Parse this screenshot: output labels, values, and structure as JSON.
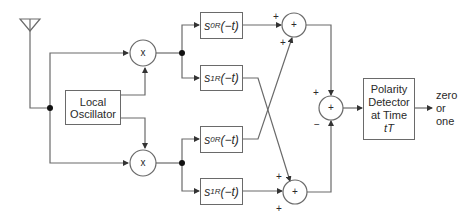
{
  "diagram": {
    "title": "",
    "blocks": {
      "local_oscillator": [
        "Local",
        "Oscillator"
      ],
      "polarity_detector": [
        "Polarity",
        "Detector",
        "at Time",
        "tT"
      ],
      "filter_upper_0": {
        "sym": "s",
        "sub": "0R",
        "arg": "(−t)"
      },
      "filter_upper_1": {
        "sym": "s",
        "sub": "1R",
        "arg": "(−t)"
      },
      "filter_lower_0": {
        "sym": "s",
        "sub": "0R",
        "arg": "(−t)"
      },
      "filter_lower_1": {
        "sym": "s",
        "sub": "1R",
        "arg": "(−t)"
      }
    },
    "operators": {
      "multiplier_symbol": "x",
      "summer_symbol": "+"
    },
    "signs": {
      "upper_summer_a": "+",
      "upper_summer_b": "+",
      "lower_summer_a": "+",
      "lower_summer_b": "+",
      "final_summer_top": "+",
      "final_summer_bottom": "−"
    },
    "output_label": [
      "zero",
      "or",
      "one"
    ],
    "icons": {
      "antenna": "antenna-icon"
    },
    "colors": {
      "line": "#6a6a6a",
      "text": "#2a2a2a",
      "background": "#ffffff"
    }
  }
}
